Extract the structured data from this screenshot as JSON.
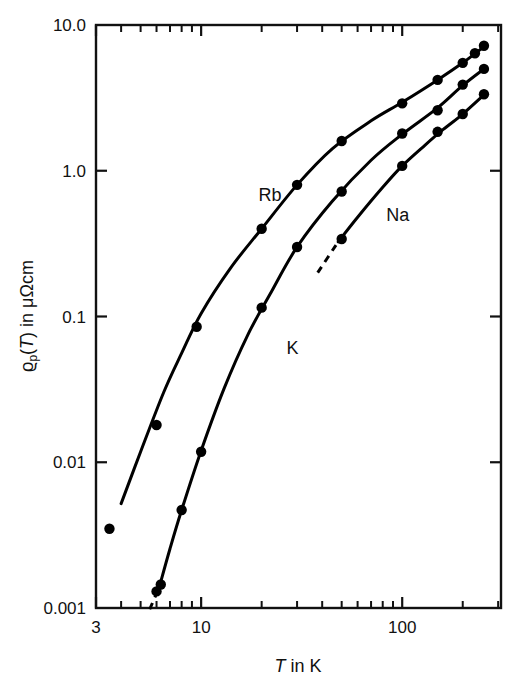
{
  "chart_data": {
    "type": "scatter",
    "title": "",
    "subtitle": "",
    "xlabel": "T in K",
    "ylabel": "ϱp(T) in μΩcm",
    "xscale": "log",
    "yscale": "log",
    "xlim": [
      3,
      310
    ],
    "ylim": [
      0.001,
      10.0
    ],
    "grid": false,
    "legend_position": "inline-annotations",
    "xticks": [
      3,
      10,
      100
    ],
    "xtick_labels": [
      "3",
      "10",
      "100"
    ],
    "xminor_ticks": [
      4,
      5,
      6,
      7,
      8,
      9,
      20,
      30,
      40,
      50,
      60,
      70,
      80,
      90,
      200,
      300
    ],
    "yticks": [
      0.001,
      0.01,
      0.1,
      1.0,
      10.0
    ],
    "ytick_labels": [
      "0.001",
      "0.01",
      "0.1",
      "1.0",
      "10.0"
    ],
    "series": [
      {
        "name": "Rb",
        "label": "Rb",
        "label_x": 22,
        "label_y": 0.62,
        "marker": "filled-circle",
        "color": "#000000",
        "x": [
          3.5,
          6.0,
          9.5,
          20.0,
          30.0,
          50.0,
          100.0,
          150.0,
          200.0,
          230.0,
          255.0
        ],
        "y": [
          0.0035,
          0.018,
          0.085,
          0.4,
          0.8,
          1.6,
          2.9,
          4.2,
          5.5,
          6.4,
          7.2
        ],
        "curve_x": [
          4.0,
          5.0,
          6.5,
          8.0,
          10.0,
          14.0,
          20.0,
          30.0,
          45.0,
          70.0,
          100.0,
          150.0,
          200.0,
          260.0
        ],
        "curve_y": [
          0.0052,
          0.0118,
          0.03,
          0.056,
          0.105,
          0.215,
          0.4,
          0.8,
          1.42,
          2.2,
          2.95,
          4.2,
          5.5,
          7.25
        ]
      },
      {
        "name": "K",
        "label": "K",
        "label_x": 28.5,
        "label_y": 0.055,
        "marker": "filled-circle",
        "color": "#000000",
        "x": [
          6.0,
          6.3,
          8.0,
          10.0,
          20.0,
          30.0,
          50.0,
          100.0,
          150.0,
          200.0,
          255.0
        ],
        "y": [
          0.0013,
          0.00145,
          0.0047,
          0.0118,
          0.115,
          0.3,
          0.72,
          1.8,
          2.6,
          3.9,
          5.0
        ],
        "curve_x": [
          6.2,
          7.0,
          8.0,
          10.0,
          13.0,
          17.0,
          22.0,
          30.0,
          45.0,
          70.0,
          100.0,
          150.0,
          200.0,
          260.0
        ],
        "curve_y": [
          0.0014,
          0.00255,
          0.0047,
          0.012,
          0.032,
          0.074,
          0.142,
          0.3,
          0.62,
          1.18,
          1.78,
          2.7,
          3.85,
          5.1
        ],
        "dashed_tail_x": [
          5.55,
          6.2
        ],
        "dashed_tail_y": [
          0.00098,
          0.0014
        ]
      },
      {
        "name": "Na",
        "label": "Na",
        "label_x": 95,
        "label_y": 0.45,
        "marker": "filled-circle",
        "color": "#000000",
        "x": [
          50.0,
          100.0,
          150.0,
          200.0,
          255.0
        ],
        "y": [
          0.34,
          1.08,
          1.85,
          2.45,
          3.35
        ],
        "curve_x": [
          48.0,
          60.0,
          80.0,
          100.0,
          130.0,
          160.0,
          200.0,
          260.0
        ],
        "curve_y": [
          0.325,
          0.48,
          0.77,
          1.08,
          1.5,
          1.92,
          2.45,
          3.4
        ],
        "dashed_tail_x": [
          38.0,
          48.0
        ],
        "dashed_tail_y": [
          0.2,
          0.325
        ]
      }
    ]
  },
  "axis": {
    "y_label_rho": "ϱ",
    "y_label_sub": "p",
    "y_label_open": "(",
    "y_label_T": "T",
    "y_label_close": ")",
    "y_label_rest": " in μΩcm",
    "x_label_T": "T",
    "x_label_rest": " in K"
  },
  "colors": {
    "axis": "#111111",
    "curve": "#000000",
    "marker": "#000000",
    "background": "#ffffff"
  }
}
